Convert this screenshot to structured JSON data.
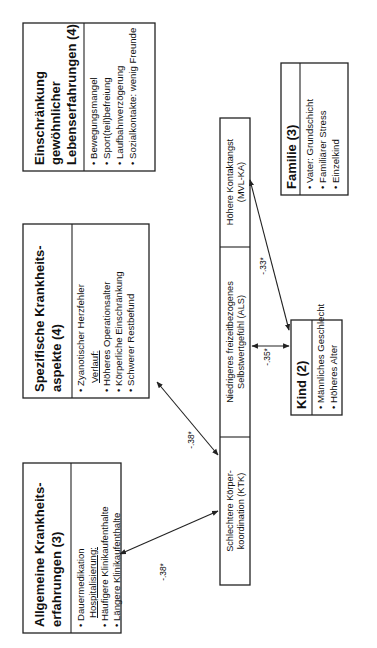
{
  "boxes": {
    "allgemeine": {
      "title_line1": "Allgemeine  Krankheits-",
      "title_line2": "erfahrungen (3)",
      "items": [
        "Dauermedikation",
        "Hospitalisierung:",
        "Häufigere Klinikaufenthalte",
        "Längere Klinikaufenthalte"
      ]
    },
    "spezifische": {
      "title_line1": "Spezifische Krankheits-",
      "title_line2": "aspekte (4)",
      "items": [
        "Zyanotischer Herzfehler",
        "Verlauf:",
        "Höheres Operationsalter",
        "Körperliche Einschränkung",
        "Schwerer Restbefund"
      ]
    },
    "einschraenkung": {
      "title_line1": "Einschränkung",
      "title_line2": "gewöhnlicher",
      "title_line3": "Lebenserfahrungen (4)",
      "items": [
        "Bewegungsmangel",
        "Sport(teil)befreiung",
        "Laufbahnverzögerung",
        "Sozialkontakte:  wenig Freunde"
      ]
    },
    "kind": {
      "title": "Kind (2)",
      "items": [
        "Männliches Geschlecht",
        "Höheres Alter"
      ]
    },
    "familie": {
      "title": "Familie (3)",
      "items": [
        "Vater: Grundschicht",
        "Familiärer Stress",
        "Einzelkind"
      ]
    }
  },
  "outcomes": {
    "ktk": {
      "line1": "Schlechtere Körper-",
      "line2": "koordination (KTK)"
    },
    "als": {
      "line1": "Niedrigeres freizeitbezogenes",
      "line2": "Selbstwertgefühl (ALS)"
    },
    "mvl": {
      "line1": "Höhere Kontaktangst",
      "line2": "(MVL-KA)"
    }
  },
  "correlations": {
    "allgemeine_ktk": "-.38*",
    "spezifische_ktk": "-.38*",
    "kind_als": "-.35*",
    "kind_mvl": "-.33*"
  }
}
